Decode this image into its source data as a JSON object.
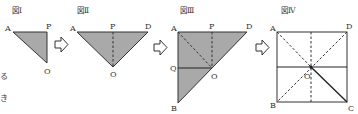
{
  "colors": {
    "fill": "#a9a9a9",
    "stroke": "#333333",
    "background": "#ffffff"
  },
  "side_text": [
    "る",
    "き"
  ],
  "figures": [
    {
      "id": "fig1",
      "title": "図Ⅰ",
      "points": {
        "A": "A",
        "P": "P",
        "O": "O"
      }
    },
    {
      "id": "fig2",
      "title": "図Ⅱ",
      "points": {
        "A": "A",
        "P": "P",
        "D": "D",
        "O": "O"
      }
    },
    {
      "id": "fig3",
      "title": "図Ⅲ",
      "points": {
        "A": "A",
        "P": "P",
        "D": "D",
        "Q": "Q",
        "O": "O",
        "B": "B"
      }
    },
    {
      "id": "fig4",
      "title": "図Ⅳ",
      "points": {
        "A": "A",
        "D": "D",
        "B": "B",
        "C": "C",
        "O": "O"
      }
    }
  ],
  "arrows": [
    "arrow-right",
    "arrow-right",
    "arrow-right"
  ]
}
